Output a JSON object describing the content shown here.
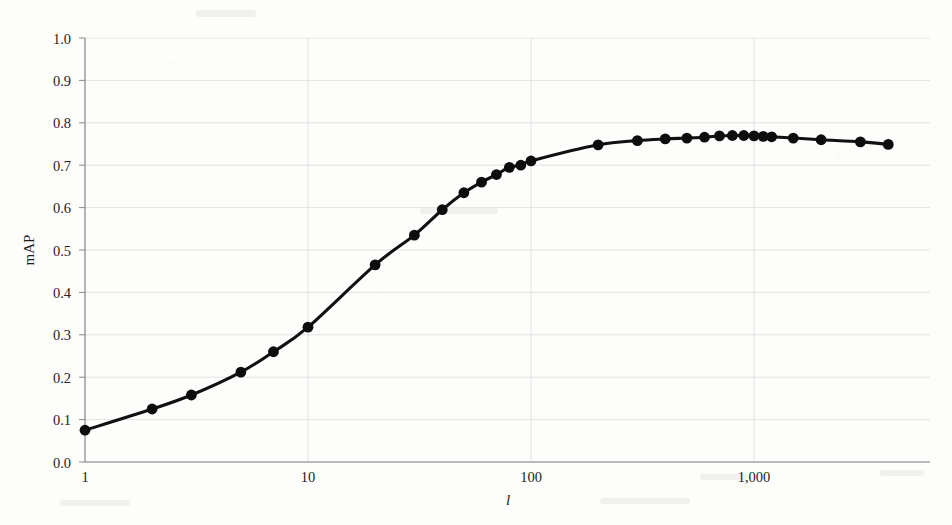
{
  "figure": {
    "y_axis_label": "mAP",
    "x_axis_label": "l"
  },
  "axes": {
    "y_ticks": [
      "0.0",
      "0.1",
      "0.2",
      "0.3",
      "0.4",
      "0.5",
      "0.6",
      "0.7",
      "0.8",
      "0.9",
      "1.0"
    ],
    "x_ticks": [
      "1",
      "10",
      "100",
      "1,000"
    ]
  },
  "colors": {
    "line": "#111111",
    "marker": "#0d0d0d",
    "grid": "#dcdcdc",
    "spine": "#7a7a7a",
    "background": "#fdfdfc",
    "text": "#242424"
  },
  "chart_data": {
    "type": "line",
    "title": "",
    "xlabel": "l",
    "ylabel": "mAP",
    "xscale": "log",
    "yscale": "linear",
    "xlim": [
      1,
      5000
    ],
    "ylim": [
      0.0,
      1.0
    ],
    "grid": true,
    "legend": "none",
    "x_tick_values": [
      1,
      10,
      100,
      1000
    ],
    "x_tick_labels": [
      "1",
      "10",
      "100",
      "1,000"
    ],
    "y_tick_values": [
      0.0,
      0.1,
      0.2,
      0.3,
      0.4,
      0.5,
      0.6,
      0.7,
      0.8,
      0.9,
      1.0
    ],
    "y_tick_labels": [
      "0.0",
      "0.1",
      "0.2",
      "0.3",
      "0.4",
      "0.5",
      "0.6",
      "0.7",
      "0.8",
      "0.9",
      "1.0"
    ],
    "series": [
      {
        "name": "mAP vs l",
        "marker": "filled-circle",
        "x": [
          1,
          2,
          3,
          5,
          7,
          10,
          20,
          30,
          40,
          50,
          60,
          70,
          80,
          90,
          100,
          200,
          300,
          400,
          500,
          600,
          700,
          800,
          900,
          1000,
          1100,
          1200,
          1500,
          2000,
          3000,
          4000
        ],
        "y": [
          0.075,
          0.125,
          0.158,
          0.212,
          0.26,
          0.318,
          0.465,
          0.535,
          0.595,
          0.635,
          0.66,
          0.678,
          0.695,
          0.7,
          0.71,
          0.748,
          0.758,
          0.762,
          0.764,
          0.766,
          0.769,
          0.77,
          0.77,
          0.769,
          0.768,
          0.767,
          0.764,
          0.76,
          0.755,
          0.749
        ]
      }
    ]
  }
}
